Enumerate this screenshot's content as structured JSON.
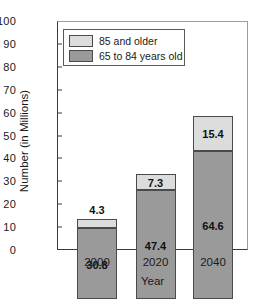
{
  "chart_data": {
    "type": "bar",
    "stacked": true,
    "title": "",
    "xlabel": "Year",
    "ylabel": "Number (in Millions)",
    "categories": [
      "2000",
      "2020",
      "2040"
    ],
    "ylim": [
      0,
      100
    ],
    "yticks": [
      100,
      90,
      80,
      70,
      60,
      50,
      40,
      30,
      20,
      10,
      0
    ],
    "grid": false,
    "legend_position": "top-left-inside",
    "series": [
      {
        "name": "85 and older",
        "color": "#dcdcdc",
        "values": [
          4.3,
          7.3,
          15.4
        ],
        "labels": [
          "4.3",
          "7.3",
          "15.4"
        ],
        "label_placement": [
          "outside-above",
          "inside",
          "inside"
        ]
      },
      {
        "name": "65 to 84 years old",
        "color": "#9a9a9a",
        "values": [
          30.8,
          47.4,
          64.6
        ],
        "labels": [
          "30.8",
          "47.4",
          "64.6"
        ],
        "label_placement": [
          "inside",
          "inside",
          "inside"
        ]
      }
    ],
    "totals": [
      35.1,
      54.7,
      80.0
    ]
  },
  "colors": {
    "older_85": "#dcdcdc",
    "age_65_84": "#9a9a9a",
    "axis": "#3a3a3a",
    "background": "#ffffff"
  }
}
